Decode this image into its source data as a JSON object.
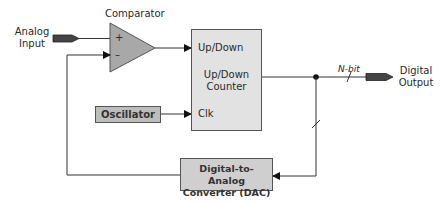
{
  "diagram": {
    "labels": {
      "analog_input": [
        "Analog",
        "Input"
      ],
      "comparator": "Comparator",
      "plus": "+",
      "minus": "–",
      "counter_updown_input": "Up/Down",
      "counter_name": [
        "Up/Down",
        "Counter"
      ],
      "counter_clk": "Clk",
      "oscillator": "Oscillator",
      "n_bit": "N-bit",
      "digital_output": [
        "Digital",
        "Output"
      ],
      "dac": [
        "Digital-to-Analog",
        "Converter (DAC)"
      ]
    },
    "colors": {
      "comparator_fill": "#a8a8a8",
      "counter_fill": "#e2e2e2",
      "oscillator_fill": "#bdbdbd",
      "dac_fill": "#cfcfcf",
      "pin_fill": "#444444",
      "wire": "#333333"
    },
    "connections": [
      {
        "from": "Analog Input",
        "to": "Comparator +"
      },
      {
        "from": "Comparator",
        "to": "Up/Down"
      },
      {
        "from": "Oscillator",
        "to": "Clk"
      },
      {
        "from": "Up/Down Counter",
        "to": "Digital Output",
        "label": "N-bit"
      },
      {
        "from": "Up/Down Counter",
        "to": "Digital-to-Analog Converter (DAC)"
      },
      {
        "from": "Digital-to-Analog Converter (DAC)",
        "to": "Comparator –"
      }
    ]
  }
}
